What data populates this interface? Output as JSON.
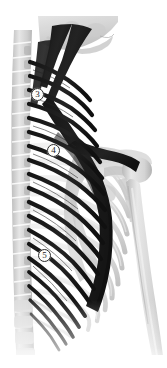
{
  "figure": {
    "kind": "anatomical-illustration",
    "view": "posterior-lateral",
    "width": 167,
    "height": 368,
    "background_color": "#ffffff"
  },
  "palette": {
    "background": "#ffffff",
    "muscle_dark": "#1c1c1c",
    "muscle_mid": "#3a3a3a",
    "bone_light": "#e9e9e9",
    "bone_mid": "#d2d2d2",
    "bone_shadow": "#b4b4b4",
    "bone_faint": "#f0f0f0",
    "outline": "#2c2c2c",
    "callout_fill": "#fdfdfb",
    "callout_text": "#1b1b1b"
  },
  "callouts": [
    {
      "id": "callout-3",
      "label": "3",
      "x": 37,
      "y": 94
    },
    {
      "id": "callout-4",
      "label": "4",
      "x": 53,
      "y": 150
    },
    {
      "id": "callout-5",
      "label": "5",
      "x": 44,
      "y": 255
    }
  ],
  "regions": [
    {
      "name": "skull-base",
      "tone": "#dedede"
    },
    {
      "name": "mandible",
      "tone": "#e4e4e4"
    },
    {
      "name": "cervical-spine",
      "tone": "#d8d8d8"
    },
    {
      "name": "thoracic-spine",
      "tone": "#d4d4d4"
    },
    {
      "name": "lumbar-spine",
      "tone": "#e2e2e2"
    },
    {
      "name": "rib-cage",
      "tone": "#dcdcdc"
    },
    {
      "name": "scapula",
      "tone": "#cfcfcf"
    },
    {
      "name": "humerus",
      "tone": "#dadada"
    },
    {
      "name": "clavicle",
      "tone": "#d6d6d6"
    },
    {
      "name": "muscle-fibers",
      "tone": "#1c1c1c"
    },
    {
      "name": "muscle-belly",
      "tone": "#1a1a1a"
    }
  ]
}
